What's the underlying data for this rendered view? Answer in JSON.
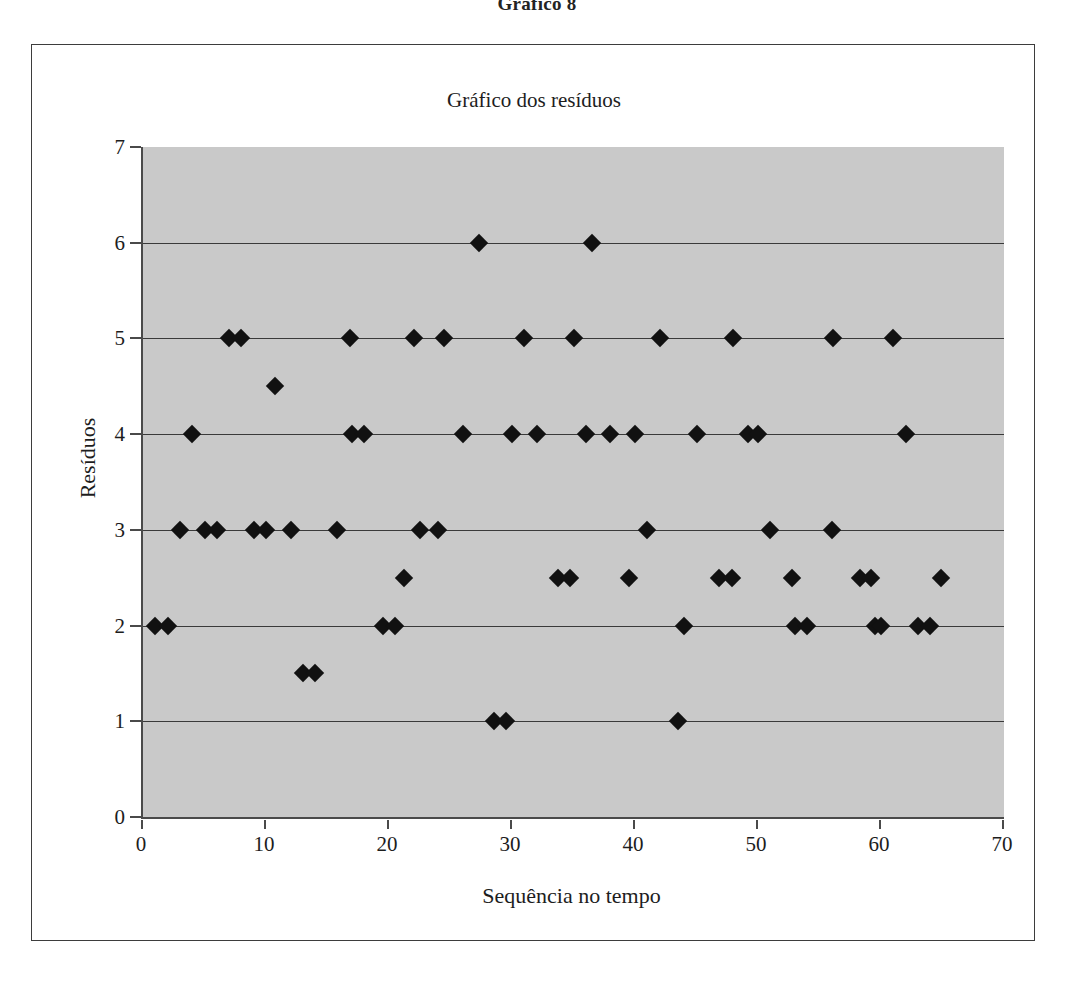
{
  "figure": {
    "caption": "Gráfico 8"
  },
  "chart_data": {
    "type": "scatter",
    "title": "Gráfico dos resíduos",
    "xlabel": "Sequência no tempo",
    "ylabel": "Resíduos",
    "xlim": [
      0,
      70
    ],
    "ylim": [
      0,
      7
    ],
    "xticks": [
      0,
      10,
      20,
      30,
      40,
      50,
      60,
      70
    ],
    "yticks": [
      0,
      1,
      2,
      3,
      4,
      5,
      6,
      7
    ],
    "xtick_labels": [
      "0",
      "10",
      "20",
      "30",
      "40",
      "50",
      "60",
      "70"
    ],
    "ytick_labels": [
      "0",
      "1",
      "2",
      "3",
      "4",
      "5",
      "6",
      "7"
    ],
    "grid": "horizontal",
    "legend": "none",
    "plot_background": "#c9c9c9",
    "marker_color": "#111111",
    "marker_shape": "diamond",
    "series": [
      {
        "name": "Resíduos",
        "x": [
          1,
          2,
          3,
          4,
          5,
          6,
          7,
          8,
          9,
          10,
          10.7,
          12,
          13,
          14,
          15.8,
          16.8,
          17,
          18,
          19.5,
          20.5,
          21.2,
          22,
          22.5,
          24,
          24.5,
          26,
          27.3,
          28.5,
          29.5,
          30,
          31,
          32,
          33.7,
          34.7,
          35,
          36,
          36.5,
          38,
          39.5,
          40,
          41,
          42,
          43.5,
          44,
          45,
          46.8,
          47.9,
          48,
          49.2,
          50,
          51,
          52.8,
          53,
          54,
          56,
          56.1,
          58.3,
          59.2,
          59.5,
          60,
          61,
          62,
          63,
          64,
          64.9
        ],
        "y": [
          2,
          2,
          3,
          4,
          3,
          3,
          5,
          5,
          3,
          3,
          4.5,
          3,
          1.5,
          1.5,
          3,
          5,
          4,
          4,
          2,
          2,
          2.5,
          5,
          3,
          3,
          5,
          4,
          6,
          1,
          1,
          4,
          5,
          4,
          2.5,
          2.5,
          5,
          4,
          6,
          4,
          2.5,
          4,
          3,
          5,
          1,
          2,
          4,
          2.5,
          2.5,
          5,
          4,
          4,
          3,
          2.5,
          2,
          2,
          3,
          5,
          2.5,
          2.5,
          2,
          2,
          5,
          4,
          2,
          2,
          2.5
        ]
      }
    ]
  }
}
